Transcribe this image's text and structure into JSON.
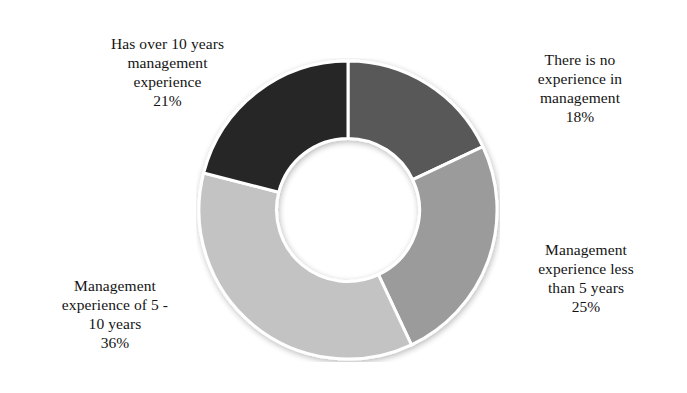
{
  "chart_data": {
    "type": "pie",
    "variant": "donut",
    "title": "",
    "xlabel": "",
    "ylabel": "",
    "units": "percent",
    "start_angle_deg": 0,
    "direction": "clockwise",
    "inner_radius_ratio": 0.48,
    "legend_position": "none",
    "labels_position": "outside-corners",
    "grid": false,
    "categories": [
      "There is no experience in management",
      "Management experience less than 5 years",
      "Management experience of 5 - 10 years",
      "Has over 10 years management experience"
    ],
    "values": [
      18,
      25,
      36,
      21
    ],
    "value_labels": [
      "18%",
      "25%",
      "36%",
      "21%"
    ],
    "colors": [
      "#585858",
      "#9b9b9b",
      "#c3c3c3",
      "#262626"
    ],
    "slices": [
      {
        "name": "There is no experience in management",
        "value": 18,
        "value_label": "18%",
        "color": "#585858",
        "start_deg": 0,
        "end_deg": 64.8
      },
      {
        "name": "Management experience less than 5 years",
        "value": 25,
        "value_label": "25%",
        "color": "#9b9b9b",
        "start_deg": 64.8,
        "end_deg": 154.8
      },
      {
        "name": "Management experience of 5 - 10 years",
        "value": 36,
        "value_label": "36%",
        "color": "#c3c3c3",
        "start_deg": 154.8,
        "end_deg": 284.4
      },
      {
        "name": "Has over 10 years management experience",
        "value": 21,
        "value_label": "21%",
        "color": "#262626",
        "start_deg": 284.4,
        "end_deg": 360
      }
    ]
  },
  "labels": {
    "top_left": {
      "text": "Has over 10 years\nmanagement\nexperience",
      "percent": "21%"
    },
    "top_right": {
      "text": "There is no\nexperience in\nmanagement",
      "percent": "18%"
    },
    "right": {
      "text": "Management\nexperience less\nthan 5 years",
      "percent": "25%"
    },
    "bottom_left": {
      "text": "Management\nexperience of 5 -\n10 years",
      "percent": "36%"
    }
  },
  "colors": {
    "background": "#ffffff",
    "text": "#141414",
    "slice_no_experience": "#585858",
    "slice_less_than_5": "#9b9b9b",
    "slice_5_to_10": "#c3c3c3",
    "slice_over_10": "#262626",
    "slice_divider": "#ffffff",
    "hole": "#ffffff"
  }
}
